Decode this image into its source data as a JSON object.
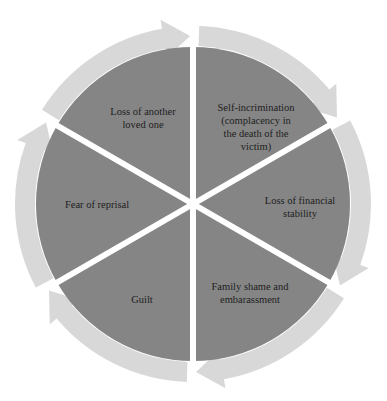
{
  "diagram": {
    "type": "cycle",
    "direction": "clockwise",
    "colors": {
      "sector_fill": "#858585",
      "ring_fill": "#d8d8d8",
      "separator": "#ffffff",
      "text": "#1e1e1e"
    },
    "segments": [
      {
        "label": "Self-incrimination\n(complacency in\nthe death of the\nvictim)",
        "text_x": 256,
        "text_y": 127
      },
      {
        "label": "Loss of financial\nstability",
        "text_x": 300,
        "text_y": 207
      },
      {
        "label": "Family shame and\nembarassment",
        "text_x": 250,
        "text_y": 293
      },
      {
        "label": "Guilt",
        "text_x": 142,
        "text_y": 299
      },
      {
        "label": "Fear of reprisal",
        "text_x": 97,
        "text_y": 204
      },
      {
        "label": "Loss of another\nloved one",
        "text_x": 143,
        "text_y": 118
      }
    ]
  }
}
